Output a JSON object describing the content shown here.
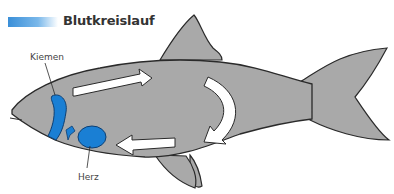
{
  "title": "Blutkreislauf",
  "labels": {
    "gills": "Kiemen",
    "heart": "Herz"
  },
  "colors": {
    "accent_blue": "#1a7fd4",
    "fish_gray": "#a9a9a9",
    "outline": "#2a2a2a",
    "arrow": "#ffffff"
  },
  "arrows": [
    {
      "id": "top",
      "direction": "right"
    },
    {
      "id": "right-curved",
      "direction": "down-left"
    },
    {
      "id": "bottom",
      "direction": "left"
    },
    {
      "id": "small-to-gills",
      "direction": "up-left"
    }
  ]
}
